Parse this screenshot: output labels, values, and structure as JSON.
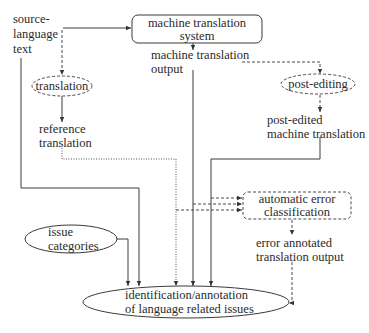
{
  "diagram": {
    "type": "flowchart",
    "nodes": {
      "source_text": {
        "lines": [
          "source-",
          "language",
          "text"
        ],
        "shape": "text"
      },
      "mt_system": {
        "lines": [
          "machine translation",
          "system"
        ],
        "shape": "rounded-rect",
        "border": "solid"
      },
      "mt_output": {
        "lines": [
          "machine translation",
          "output"
        ],
        "shape": "text"
      },
      "translation": {
        "lines": [
          "translation"
        ],
        "shape": "ellipse",
        "border": "dashed"
      },
      "post_editing": {
        "lines": [
          "post-editing"
        ],
        "shape": "ellipse",
        "border": "dashed"
      },
      "reference_translation": {
        "lines": [
          "reference",
          "translation"
        ],
        "shape": "text"
      },
      "post_edited_mt": {
        "lines": [
          "post-edited",
          "machine translation"
        ],
        "shape": "text"
      },
      "automatic_error_classification": {
        "lines": [
          "automatic error",
          "classification"
        ],
        "shape": "rounded-rect",
        "border": "dashed"
      },
      "error_annotated_output": {
        "lines": [
          "error annotated",
          "translation output"
        ],
        "shape": "text"
      },
      "issue_categories": {
        "lines": [
          "issue",
          "categories"
        ],
        "shape": "ellipse",
        "border": "solid"
      },
      "identification": {
        "lines": [
          "identification/annotation",
          "of language related issues"
        ],
        "shape": "ellipse",
        "border": "solid"
      }
    },
    "edges": [
      {
        "from": "source_text",
        "to": "mt_system",
        "style": "solid"
      },
      {
        "from": "source_text",
        "to": "translation",
        "style": "dashed"
      },
      {
        "from": "mt_system",
        "to": "mt_output",
        "style": "solid"
      },
      {
        "from": "mt_output",
        "to": "post_editing",
        "style": "dashed"
      },
      {
        "from": "translation",
        "to": "reference_translation",
        "style": "solid"
      },
      {
        "from": "post_editing",
        "to": "post_edited_mt",
        "style": "dashed"
      },
      {
        "from": "source_text",
        "to": "identification",
        "style": "solid"
      },
      {
        "from": "reference_translation",
        "to": "identification",
        "style": "dotted"
      },
      {
        "from": "mt_output",
        "to": "identification",
        "style": "solid"
      },
      {
        "from": "post_edited_mt",
        "to": "identification",
        "style": "solid"
      },
      {
        "from": "issue_categories",
        "to": "identification",
        "style": "solid"
      },
      {
        "from": "reference_translation",
        "to": "automatic_error_classification",
        "style": "dashed"
      },
      {
        "from": "mt_output",
        "to": "automatic_error_classification",
        "style": "dashed"
      },
      {
        "from": "post_edited_mt",
        "to": "automatic_error_classification",
        "style": "dashed"
      },
      {
        "from": "automatic_error_classification",
        "to": "error_annotated_output",
        "style": "dashed"
      },
      {
        "from": "error_annotated_output",
        "to": "identification",
        "style": "dashed"
      }
    ]
  }
}
